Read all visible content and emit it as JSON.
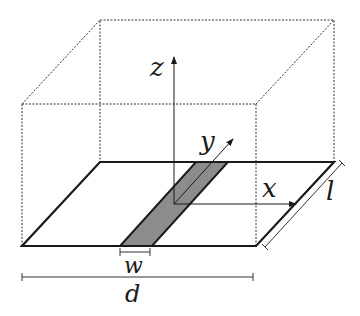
{
  "figure": {
    "type": "3d-box-microstrip-geometry",
    "labels": {
      "z_axis": "z",
      "y_axis": "y",
      "x_axis": "x",
      "strip_width": "w",
      "plane_width": "d",
      "plane_length": "l"
    },
    "colors": {
      "line": "#1a1a1a",
      "strip_fill": "#8c8c8c",
      "background": "#ffffff"
    }
  }
}
